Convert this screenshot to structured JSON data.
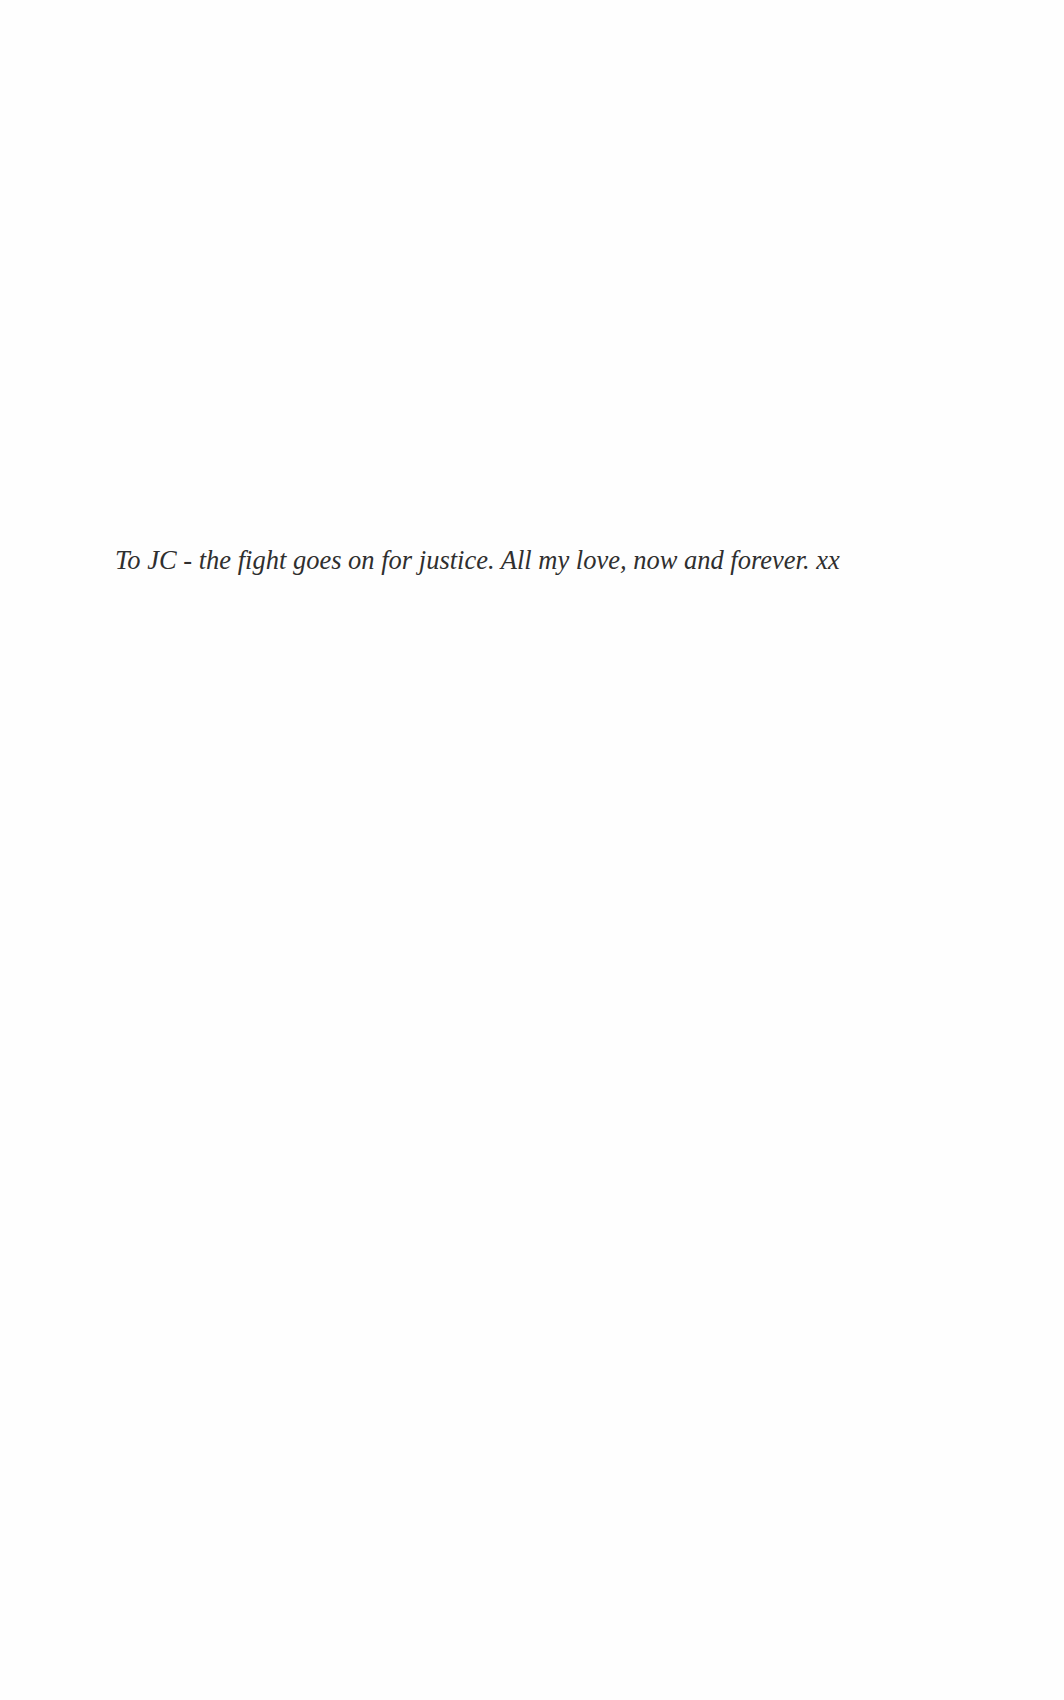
{
  "page": {
    "type": "dedication",
    "dedication": {
      "text": "To JC - the fight goes on for justice. All my love, now and forever. xx"
    }
  }
}
